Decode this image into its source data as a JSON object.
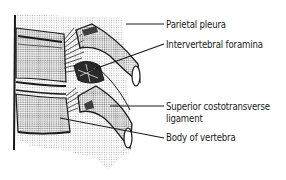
{
  "figure": {
    "labels": [
      {
        "id": "parietal-pleura",
        "text": "Parietal pleura"
      },
      {
        "id": "intervertebral-foramina",
        "text": "Intervertebral foramina"
      },
      {
        "id": "superior-costotransverse-ligament",
        "text_line1": "Superior costotransverse",
        "text_line2": "ligament"
      },
      {
        "id": "body-of-vertebra",
        "text": "Body of vertebra"
      }
    ],
    "colors": {
      "ink": "#1a1a1a",
      "halftone": "#9a9a9a",
      "background": "#ffffff"
    }
  }
}
